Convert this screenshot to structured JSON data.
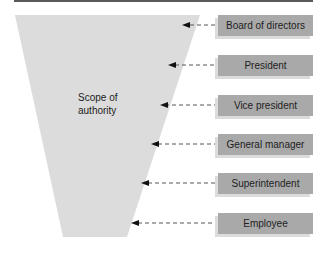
{
  "diagram": {
    "funnel_label": "Scope of authority",
    "funnel_label_line1": "Scope of",
    "funnel_label_line2": "authority",
    "levels": [
      {
        "label": "Board of directors"
      },
      {
        "label": "President"
      },
      {
        "label": "Vice president"
      },
      {
        "label": "General manager"
      },
      {
        "label": "Superintendent"
      },
      {
        "label": "Employee"
      }
    ],
    "colors": {
      "funnel": "#dcdcdc",
      "box": "#a9a9a9",
      "border": "#5a5a5a"
    }
  }
}
